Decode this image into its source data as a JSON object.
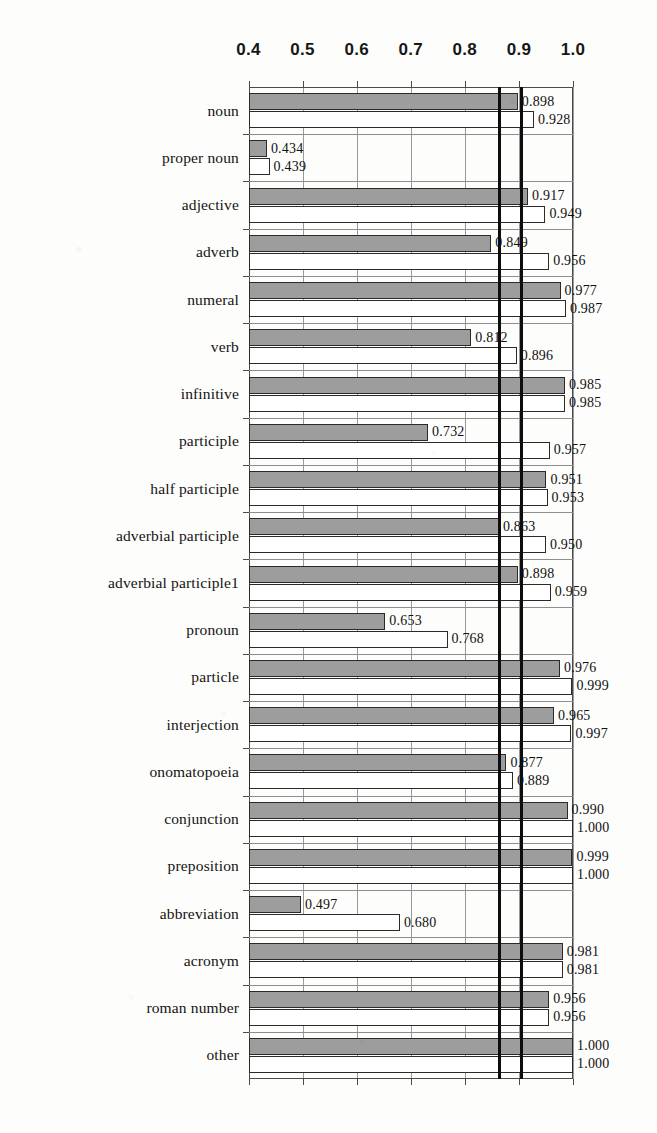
{
  "chart_data": {
    "type": "bar",
    "orientation": "horizontal",
    "title": "",
    "xlabel": "",
    "ylabel": "",
    "xlim": [
      0.39,
      1.0
    ],
    "xticks": [
      "0.4",
      "0.5",
      "0.6",
      "0.7",
      "0.8",
      "0.9",
      "1.0"
    ],
    "xtick_values": [
      0.4,
      0.5,
      0.6,
      0.7,
      0.8,
      0.9,
      1.0
    ],
    "grid": true,
    "legend": "none",
    "bar_baseline": 0.39,
    "reference_lines": [
      0.862,
      0.902
    ],
    "categories": [
      "noun",
      "proper noun",
      "adjective",
      "adverb",
      "numeral",
      "verb",
      "infinitive",
      "participle",
      "half participle",
      "adverbial participle",
      "adverbial participle1",
      "pronoun",
      "particle",
      "interjection",
      "onomatopoeia",
      "conjunction",
      "preposition",
      "abbreviation",
      "acronym",
      "roman number",
      "other"
    ],
    "series": [
      {
        "name": "series-a",
        "style": "filled-gray",
        "color": "#9d9d9d",
        "values": [
          0.898,
          0.434,
          0.917,
          0.849,
          0.977,
          0.812,
          0.985,
          0.732,
          0.951,
          0.863,
          0.898,
          0.653,
          0.976,
          0.965,
          0.877,
          0.99,
          0.999,
          0.497,
          0.981,
          0.956,
          1.0
        ],
        "labels": [
          "0.898",
          "0.434",
          "0.917",
          "0.849",
          "0.977",
          "0.812",
          "0.985",
          "0.732",
          "0.951",
          "0.863",
          "0.898",
          "0.653",
          "0.976",
          "0.965",
          "0.877",
          "0.990",
          "0.999",
          "0.497",
          "0.981",
          "0.956",
          "1.000"
        ]
      },
      {
        "name": "series-b",
        "style": "open-white",
        "color": "#ffffff",
        "values": [
          0.928,
          0.439,
          0.949,
          0.956,
          0.987,
          0.896,
          0.985,
          0.957,
          0.953,
          0.95,
          0.959,
          0.768,
          0.999,
          0.997,
          0.889,
          1.0,
          1.0,
          0.68,
          0.981,
          0.956,
          1.0
        ],
        "labels": [
          "0.928",
          "0.439",
          "0.949",
          "0.956",
          "0.987",
          "0.896",
          "0.985",
          "0.957",
          "0.953",
          "0.950",
          "0.959",
          "0.768",
          "0.999",
          "0.997",
          "0.889",
          "1.000",
          "1.000",
          "0.680",
          "0.981",
          "0.956",
          "1.000"
        ]
      }
    ]
  }
}
